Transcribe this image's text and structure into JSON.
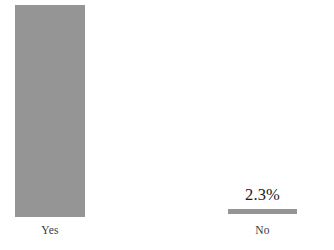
{
  "chart_data": {
    "type": "bar",
    "title": "",
    "subtitle": "",
    "xlabel": "",
    "ylabel": "",
    "categories": [
      "Yes",
      "No"
    ],
    "values": [
      97.7,
      2.3
    ],
    "value_labels": [
      "97.7%",
      "2.3%"
    ],
    "units": "percent",
    "ylim": [
      0,
      100
    ],
    "grid": false,
    "legend": false,
    "axes_visible": false,
    "orientation": "vertical",
    "series": [
      {
        "name": "",
        "values": [
          97.7,
          2.3
        ],
        "color": "#959595"
      }
    ],
    "colors": {
      "bar": "#959595",
      "background": "#ffffff",
      "value_label_text": "#1a1a1a",
      "tick_label_text": "#3a3a3a"
    },
    "bars": [
      {
        "category": "Yes",
        "value": 97.7,
        "value_label": "97.7%",
        "tick_label": "Yes",
        "height_pct": "97.7%",
        "color": "#959595"
      },
      {
        "category": "No",
        "value": 2.3,
        "value_label": "2.3%",
        "tick_label": "No",
        "height_pct": "2.3%",
        "color": "#959595"
      }
    ]
  }
}
